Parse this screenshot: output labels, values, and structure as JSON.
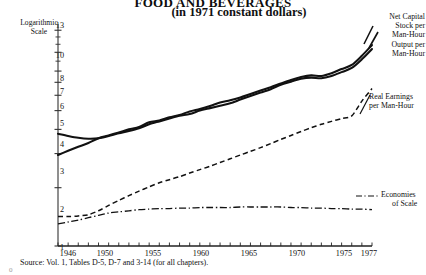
{
  "figure": {
    "title": "FOOD AND BEVERAGES",
    "subtitle": "(in 1971 constant dollars)",
    "y_axis_caption_line1": "Logarithmic",
    "y_axis_caption_line2": "Scale",
    "source": "Source: Vol. 1, Tables D-5, D-7 and 3-14 (for all chapters).",
    "stray_mark": "0"
  },
  "labels": {
    "net_capital_stock": "Net Capital\nStock per\nMan-Hour",
    "net_capital_stock_l1": "Net Capital",
    "net_capital_stock_l2": "Stock per",
    "net_capital_stock_l3": "Man-Hour",
    "output_l1": "Output per",
    "output_l2": "Man-Hour",
    "real_earnings_l1": "Real Earnings",
    "real_earnings_l2": "per Man-Hour",
    "economies_l1": "Economies",
    "economies_l2": "of Scale"
  },
  "colors": {
    "ink": "#111111",
    "axis": "#333333",
    "background": "#ffffff"
  },
  "chart_data": {
    "type": "line",
    "title": "FOOD AND BEVERAGES",
    "subtitle": "(in 1971 constant dollars)",
    "xlabel": "",
    "ylabel": "Logarithmic Scale",
    "y_scale": "log",
    "ylim": [
      1,
      14
    ],
    "xlim": [
      1946,
      1977
    ],
    "grid": false,
    "legend": "right-inline-annotations",
    "yticks": [
      1,
      2,
      3,
      4,
      5,
      6,
      7,
      8,
      10,
      13
    ],
    "ytick_labels": [
      "1",
      "2",
      "3",
      "4",
      "5",
      "6",
      "7",
      "8",
      "10",
      "13"
    ],
    "xticks": [
      1946,
      1950,
      1955,
      1960,
      1965,
      1970,
      1975,
      1977
    ],
    "xtick_labels": [
      "1946",
      "1950",
      "1955",
      "1960",
      "1965",
      "1970",
      "1975",
      "1977"
    ],
    "x": [
      1946,
      1947,
      1948,
      1949,
      1950,
      1951,
      1952,
      1953,
      1954,
      1955,
      1956,
      1957,
      1958,
      1959,
      1960,
      1961,
      1962,
      1963,
      1964,
      1965,
      1966,
      1967,
      1968,
      1969,
      1970,
      1971,
      1972,
      1973,
      1974,
      1975,
      1976,
      1977
    ],
    "series": [
      {
        "name": "Net Capital Stock per Man-Hour",
        "style": "solid",
        "values": [
          3.8,
          3.7,
          3.62,
          3.58,
          3.6,
          3.7,
          3.82,
          3.92,
          4.05,
          4.25,
          4.4,
          4.55,
          4.7,
          4.8,
          5.0,
          5.15,
          5.3,
          5.45,
          5.7,
          5.95,
          6.2,
          6.45,
          6.8,
          7.05,
          7.3,
          7.4,
          7.35,
          7.55,
          7.9,
          8.3,
          9.2,
          10.4
        ]
      },
      {
        "name": "Output per Man-Hour",
        "style": "solid",
        "values": [
          2.95,
          3.1,
          3.25,
          3.4,
          3.6,
          3.72,
          3.85,
          4.0,
          4.12,
          4.35,
          4.45,
          4.62,
          4.75,
          4.95,
          5.1,
          5.28,
          5.5,
          5.65,
          5.85,
          6.1,
          6.35,
          6.6,
          6.9,
          7.2,
          7.45,
          7.6,
          7.55,
          7.8,
          8.2,
          8.6,
          9.6,
          10.9
        ]
      },
      {
        "name": "Real Earnings per Man-Hour",
        "style": "dashed",
        "values": [
          1.42,
          1.42,
          1.43,
          1.45,
          1.52,
          1.62,
          1.72,
          1.82,
          1.92,
          2.02,
          2.12,
          2.2,
          2.28,
          2.38,
          2.48,
          2.58,
          2.7,
          2.82,
          2.95,
          3.08,
          3.22,
          3.38,
          3.55,
          3.72,
          3.9,
          4.08,
          4.25,
          4.4,
          4.55,
          4.7,
          5.6,
          6.5
        ]
      },
      {
        "name": "Economies of Scale",
        "style": "dash-dot",
        "values": [
          1.3,
          1.33,
          1.36,
          1.4,
          1.44,
          1.48,
          1.5,
          1.52,
          1.54,
          1.55,
          1.56,
          1.56,
          1.57,
          1.57,
          1.58,
          1.58,
          1.58,
          1.58,
          1.59,
          1.59,
          1.59,
          1.59,
          1.59,
          1.58,
          1.58,
          1.57,
          1.57,
          1.56,
          1.56,
          1.55,
          1.55,
          1.54
        ]
      }
    ]
  }
}
